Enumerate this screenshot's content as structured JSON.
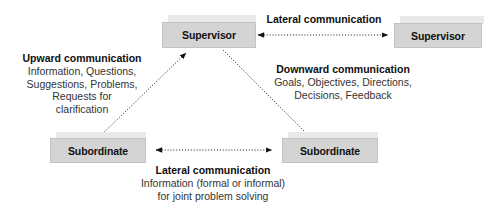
{
  "diagram": {
    "colors": {
      "node_fill": "#d4d4d4",
      "node_border": "#c2c2c2",
      "node_tab": "#e9e9e9",
      "text": "#2b2b2b",
      "heading": "#0f0f0f",
      "arrow": "#1a1a1a",
      "background": "#ffffff"
    },
    "nodes": [
      {
        "id": "supervisor-left",
        "label": "Supervisor"
      },
      {
        "id": "supervisor-right",
        "label": "Supervisor"
      },
      {
        "id": "subordinate-left",
        "label": "Subordinate"
      },
      {
        "id": "subordinate-right",
        "label": "Subordinate"
      }
    ],
    "annotations": {
      "lateral_top": {
        "heading": "Lateral communication",
        "lines": []
      },
      "upward": {
        "heading": "Upward communication",
        "lines": [
          "Information, Questions,",
          "Suggestions, Problems,",
          "Requests for",
          "clarification"
        ]
      },
      "downward": {
        "heading": "Downward communication",
        "lines": [
          "Goals, Objectives, Directions,",
          "Decisions, Feedback"
        ]
      },
      "lateral_bottom": {
        "heading": "Lateral communication",
        "lines": [
          "Information (formal or informal)",
          "for joint problem solving"
        ]
      }
    },
    "arrows": [
      {
        "id": "arrow-lateral-top",
        "style": "dotted",
        "heads": "both",
        "from": "supervisor-left",
        "to": "supervisor-right"
      },
      {
        "id": "arrow-lateral-bottom",
        "style": "dotted",
        "heads": "both",
        "from": "subordinate-left",
        "to": "subordinate-right"
      },
      {
        "id": "arrow-upward",
        "style": "dotted",
        "heads": "end",
        "from": "subordinate-left",
        "to": "supervisor-left"
      },
      {
        "id": "arrow-downward",
        "style": "dotted",
        "heads": "end",
        "from": "supervisor-left",
        "to": "subordinate-right"
      }
    ]
  }
}
